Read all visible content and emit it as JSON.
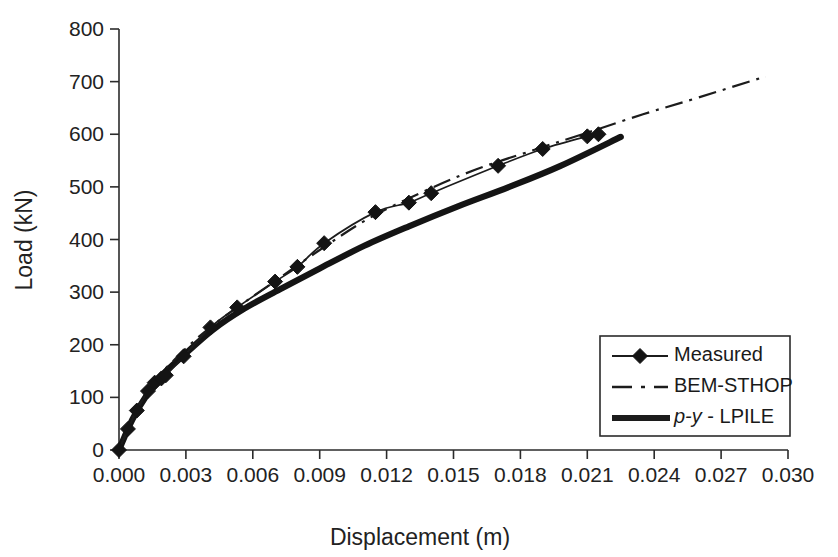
{
  "chart_data": {
    "type": "line",
    "title": "",
    "xlabel": "Displacement (m)",
    "ylabel": "Load (kN)",
    "xlim": [
      0.0,
      0.03
    ],
    "ylim": [
      0,
      800
    ],
    "xticks": [
      "0.000",
      "0.003",
      "0.006",
      "0.009",
      "0.012",
      "0.015",
      "0.018",
      "0.021",
      "0.024",
      "0.027",
      "0.030"
    ],
    "xtick_values": [
      0.0,
      0.003,
      0.006,
      0.009,
      0.012,
      0.015,
      0.018,
      0.021,
      0.024,
      0.027,
      0.03
    ],
    "yticks": [
      "0",
      "100",
      "200",
      "300",
      "400",
      "500",
      "600",
      "700",
      "800"
    ],
    "ytick_values": [
      0,
      100,
      200,
      300,
      400,
      500,
      600,
      700,
      800
    ],
    "grid": false,
    "legend_position": "lower-right",
    "series": [
      {
        "name": "Measured",
        "style": "thin-solid-with-diamond-markers",
        "marker": "diamond",
        "x": [
          0.0,
          0.0004,
          0.0008,
          0.0013,
          0.0016,
          0.0019,
          0.0021,
          0.0029,
          0.0041,
          0.0053,
          0.007,
          0.008,
          0.0092,
          0.0115,
          0.013,
          0.014,
          0.017,
          0.019,
          0.021,
          0.0215
        ],
        "y": [
          0,
          40,
          75,
          112,
          128,
          136,
          142,
          178,
          233,
          271,
          320,
          348,
          393,
          452,
          470,
          488,
          540,
          572,
          596,
          600
        ]
      },
      {
        "name": "BEM-STHOP",
        "style": "dash-dot",
        "marker": "none",
        "x": [
          0.0,
          0.0008,
          0.0016,
          0.0024,
          0.0036,
          0.005,
          0.0068,
          0.009,
          0.0112,
          0.0136,
          0.016,
          0.0186,
          0.021,
          0.0235,
          0.026,
          0.029
        ],
        "y": [
          0,
          78,
          132,
          168,
          216,
          262,
          315,
          380,
          440,
          490,
          533,
          570,
          603,
          638,
          670,
          710
        ]
      },
      {
        "name": "p-y - LPILE",
        "style": "thick-solid",
        "marker": "none",
        "x": [
          0.0,
          0.0006,
          0.0013,
          0.002,
          0.0029,
          0.0042,
          0.0056,
          0.0072,
          0.009,
          0.011,
          0.013,
          0.0152,
          0.0175,
          0.0198,
          0.0225
        ],
        "y": [
          0,
          58,
          108,
          145,
          180,
          228,
          268,
          305,
          345,
          388,
          425,
          463,
          500,
          540,
          595
        ]
      }
    ]
  },
  "legend": {
    "entries": [
      {
        "label": "Measured",
        "italic_prefix": "",
        "style": "marker-line"
      },
      {
        "label": "BEM-STHOP",
        "italic_prefix": "",
        "style": "dash-dot"
      },
      {
        "label": " - LPILE",
        "italic_prefix": "p-y",
        "style": "thick-solid"
      }
    ]
  }
}
